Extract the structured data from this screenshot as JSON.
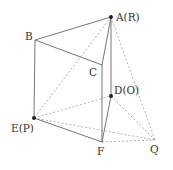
{
  "diagram": {
    "type": "geometry-solid",
    "points": {
      "A": {
        "x": 111,
        "y": 17,
        "label": "A(R)",
        "dot": true,
        "lx": 116,
        "ly": 21
      },
      "B": {
        "x": 35,
        "y": 40,
        "label": "B",
        "dot": false,
        "lx": 25,
        "ly": 40
      },
      "C": {
        "x": 102,
        "y": 65,
        "label": "C",
        "dot": false,
        "lx": 89,
        "ly": 76
      },
      "D": {
        "x": 111,
        "y": 96,
        "label": "D(O)",
        "dot": true,
        "lx": 114,
        "ly": 94
      },
      "E": {
        "x": 34,
        "y": 118,
        "label": "E(P)",
        "dot": true,
        "lx": 11,
        "ly": 132
      },
      "F": {
        "x": 102,
        "y": 142,
        "label": "F",
        "dot": false,
        "lx": 97,
        "ly": 155
      },
      "Q": {
        "x": 155,
        "y": 140,
        "label": "Q",
        "dot": false,
        "lx": 150,
        "ly": 153
      }
    },
    "solid_edges": [
      [
        "A",
        "B"
      ],
      [
        "B",
        "C"
      ],
      [
        "A",
        "C"
      ],
      [
        "B",
        "E"
      ],
      [
        "C",
        "F"
      ],
      [
        "E",
        "F"
      ],
      [
        "A",
        "D"
      ],
      [
        "D",
        "F"
      ]
    ],
    "dashed_edges": [
      [
        "A",
        "E"
      ],
      [
        "A",
        "Q"
      ],
      [
        "E",
        "D"
      ],
      [
        "E",
        "Q"
      ],
      [
        "D",
        "Q"
      ],
      [
        "F",
        "Q"
      ]
    ],
    "labels": {
      "A": "A(R)",
      "B": "B",
      "C": "C",
      "D": "D(O)",
      "E": "E(P)",
      "F": "F",
      "Q": "Q"
    }
  }
}
